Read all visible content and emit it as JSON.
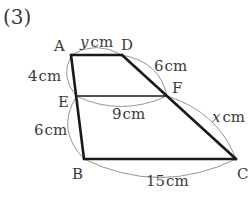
{
  "problem_number": "(3)",
  "vertices": {
    "A": {
      "label": "A",
      "x": 71,
      "y": 55
    },
    "D": {
      "label": "D",
      "x": 122,
      "y": 55
    },
    "E": {
      "label": "E",
      "x": 76,
      "y": 96
    },
    "F": {
      "label": "F",
      "x": 167,
      "y": 96
    },
    "B": {
      "label": "B",
      "x": 84,
      "y": 159
    },
    "C": {
      "label": "C",
      "x": 236,
      "y": 159
    }
  },
  "segments": [
    {
      "name": "AD",
      "from": "A",
      "to": "D",
      "weight": "bold"
    },
    {
      "name": "AB",
      "from": "A",
      "to": "B",
      "weight": "bold"
    },
    {
      "name": "BC",
      "from": "B",
      "to": "C",
      "weight": "bold"
    },
    {
      "name": "DC",
      "from": "D",
      "to": "C",
      "weight": "bold"
    },
    {
      "name": "EF",
      "from": "E",
      "to": "F",
      "weight": "thin"
    }
  ],
  "measurements": {
    "AD": {
      "var": "y",
      "unit": "cm"
    },
    "AE": {
      "value": "4",
      "unit": "cm"
    },
    "EB": {
      "value": "6",
      "unit": "cm"
    },
    "DF": {
      "value": "6",
      "unit": "cm"
    },
    "EF": {
      "value": "9",
      "unit": "cm"
    },
    "FC": {
      "var": "x",
      "unit": "cm"
    },
    "BC": {
      "value": "15",
      "unit": "cm"
    }
  },
  "colors": {
    "line": "#1a1a1a",
    "arc": "#8a8a8a",
    "text": "#3a3a3a"
  }
}
